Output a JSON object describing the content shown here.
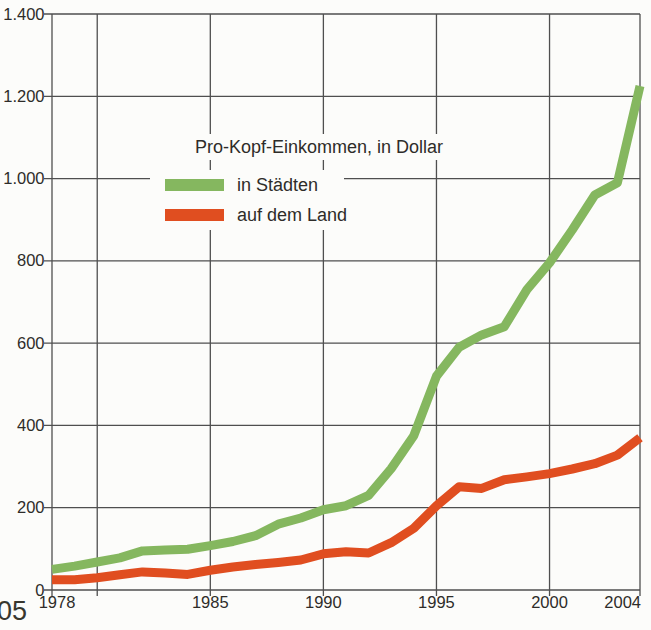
{
  "page": {
    "background_color": "#fcfcfa",
    "corner_text": "05"
  },
  "chart_data": {
    "type": "line",
    "title": "Pro-Kopf-Einkommen, in Dollar",
    "xlabel": "",
    "ylabel": "",
    "xlim": [
      1978,
      2004
    ],
    "ylim": [
      0,
      1400
    ],
    "grid": true,
    "grid_color": "#4f4f4f",
    "text_color": "#2e2c29",
    "legend_position": "upper-center-inside",
    "line_width": 9,
    "x": [
      1978,
      1979,
      1980,
      1981,
      1982,
      1983,
      1984,
      1985,
      1986,
      1987,
      1988,
      1989,
      1990,
      1991,
      1992,
      1993,
      1994,
      1995,
      1996,
      1997,
      1998,
      1999,
      2000,
      2001,
      2002,
      2003,
      2004
    ],
    "series": [
      {
        "name": "in Städten",
        "color": "#85b75f",
        "values": [
          50,
          58,
          68,
          78,
          95,
          97,
          99,
          108,
          118,
          132,
          160,
          175,
          195,
          205,
          230,
          295,
          375,
          520,
          590,
          620,
          640,
          730,
          795,
          875,
          960,
          990,
          1225
        ]
      },
      {
        "name": "auf dem Land",
        "color": "#e04e20",
        "values": [
          25,
          25,
          30,
          37,
          44,
          41,
          38,
          48,
          56,
          62,
          67,
          73,
          88,
          93,
          90,
          115,
          150,
          205,
          251,
          247,
          268,
          275,
          283,
          294,
          307,
          328,
          370
        ]
      }
    ],
    "y_ticks": [
      {
        "value": 0,
        "label": "0"
      },
      {
        "value": 200,
        "label": "200"
      },
      {
        "value": 400,
        "label": "400"
      },
      {
        "value": 600,
        "label": "600"
      },
      {
        "value": 800,
        "label": "800"
      },
      {
        "value": 1000,
        "label": "1.000"
      },
      {
        "value": 1200,
        "label": "1.200"
      },
      {
        "value": 1400,
        "label": "1.400"
      }
    ],
    "x_ticks": [
      {
        "year": 1978,
        "label": "1978"
      },
      {
        "year": 1985,
        "label": "1985"
      },
      {
        "year": 1990,
        "label": "1990"
      },
      {
        "year": 1995,
        "label": "1995"
      },
      {
        "year": 2000,
        "label": "2000"
      },
      {
        "year": 2004,
        "label": "2004"
      }
    ],
    "x_gridline_years": [
      1980,
      1985,
      1990,
      1995,
      2000
    ]
  }
}
